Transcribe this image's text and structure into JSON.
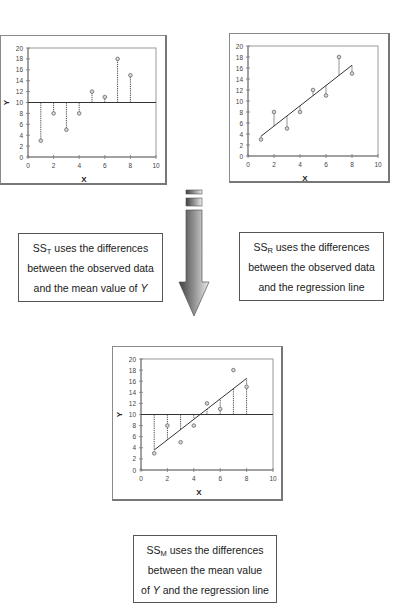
{
  "colors": {
    "axis": "#777777",
    "frame": "#8a8a8a",
    "line": "#333333",
    "residual": "#444444",
    "point_fill": "#d8d8d8",
    "point_stroke": "#666666",
    "arrow_dark": "#4a4a4a",
    "arrow_light": "#e6e6e6"
  },
  "chart_data": [
    {
      "id": "ss_t_plot",
      "type": "scatter",
      "title": "",
      "xlabel": "X",
      "ylabel": "Y",
      "xlim": [
        0,
        10
      ],
      "ylim": [
        0,
        20
      ],
      "xticks": [
        0,
        2,
        4,
        6,
        8,
        10
      ],
      "yticks": [
        0,
        2,
        4,
        6,
        8,
        10,
        12,
        14,
        16,
        18,
        20
      ],
      "grid": false,
      "points": [
        {
          "x": 1,
          "y": 3
        },
        {
          "x": 2,
          "y": 8
        },
        {
          "x": 3,
          "y": 5
        },
        {
          "x": 4,
          "y": 8
        },
        {
          "x": 5,
          "y": 12
        },
        {
          "x": 6,
          "y": 11
        },
        {
          "x": 7,
          "y": 18
        },
        {
          "x": 8,
          "y": 15
        }
      ],
      "mean_line": 10,
      "regression_line": null,
      "residuals": "point-to-mean (dotted)"
    },
    {
      "id": "ss_r_plot",
      "type": "scatter",
      "title": "",
      "xlabel": "X",
      "ylabel": "Y",
      "xlim": [
        0,
        10
      ],
      "ylim": [
        0,
        20
      ],
      "xticks": [
        0,
        2,
        4,
        6,
        8,
        10
      ],
      "yticks": [
        0,
        2,
        4,
        6,
        8,
        10,
        12,
        14,
        16,
        18,
        20
      ],
      "grid": false,
      "points": [
        {
          "x": 1,
          "y": 3
        },
        {
          "x": 2,
          "y": 8
        },
        {
          "x": 3,
          "y": 5
        },
        {
          "x": 4,
          "y": 8
        },
        {
          "x": 5,
          "y": 12
        },
        {
          "x": 6,
          "y": 11
        },
        {
          "x": 7,
          "y": 18
        },
        {
          "x": 8,
          "y": 15
        }
      ],
      "mean_line": null,
      "regression_line": {
        "x1": 1,
        "y1": 3.6,
        "x2": 8,
        "y2": 16.5
      },
      "residuals": "point-to-regression (solid)"
    },
    {
      "id": "ss_m_plot",
      "type": "scatter",
      "title": "",
      "xlabel": "X",
      "ylabel": "Y",
      "xlim": [
        0,
        10
      ],
      "ylim": [
        0,
        20
      ],
      "xticks": [
        0,
        2,
        4,
        6,
        8,
        10
      ],
      "yticks": [
        0,
        2,
        4,
        6,
        8,
        10,
        12,
        14,
        16,
        18,
        20
      ],
      "grid": false,
      "points": [
        {
          "x": 1,
          "y": 3
        },
        {
          "x": 2,
          "y": 8
        },
        {
          "x": 3,
          "y": 5
        },
        {
          "x": 4,
          "y": 8
        },
        {
          "x": 5,
          "y": 12
        },
        {
          "x": 6,
          "y": 11
        },
        {
          "x": 7,
          "y": 18
        },
        {
          "x": 8,
          "y": 15
        }
      ],
      "mean_line": 10,
      "regression_line": {
        "x1": 1,
        "y1": 3.6,
        "x2": 8,
        "y2": 16.5
      },
      "residuals": "mean-to-regression (dotted)"
    }
  ],
  "panels": {
    "top_left": {
      "x": 0,
      "y": 35,
      "w": 167,
      "h": 150,
      "plot": {
        "l": 27,
        "t": 12,
        "w": 128,
        "h": 109
      }
    },
    "top_right": {
      "x": 229,
      "y": 33,
      "w": 161,
      "h": 150,
      "plot": {
        "l": 18,
        "t": 12,
        "w": 130,
        "h": 110
      }
    },
    "bottom": {
      "x": 112,
      "y": 346,
      "w": 171,
      "h": 155,
      "plot": {
        "l": 28,
        "t": 12,
        "w": 132,
        "h": 111
      }
    }
  },
  "captions": {
    "ss_t": {
      "symbol": "SS",
      "subscript": "T",
      "line1_rest": " uses the differences",
      "line2": "between the observed data",
      "line3_pre": "and the mean value of ",
      "line3_var": "Y",
      "line3_post": ""
    },
    "ss_r": {
      "symbol": "SS",
      "subscript": "R",
      "line1_rest": " uses the differences",
      "line2": "between the observed data",
      "line3_pre": "and the regression line",
      "line3_var": "",
      "line3_post": ""
    },
    "ss_m": {
      "symbol": "SS",
      "subscript": "M",
      "line1_rest": " uses the differences",
      "line2": "between the mean value",
      "line3_pre": "of ",
      "line3_var": "Y",
      "line3_post": " and the regression line"
    }
  },
  "icons": {
    "arrow": "down-arrow-icon"
  }
}
